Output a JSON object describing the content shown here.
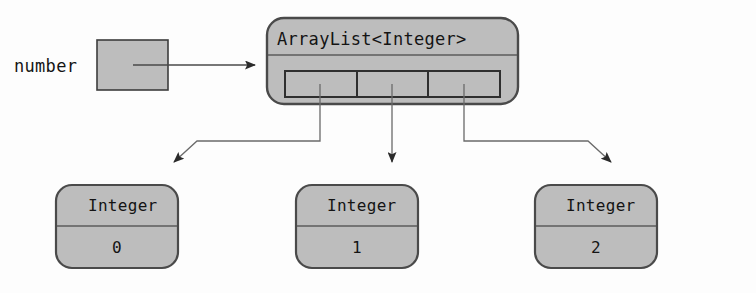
{
  "diagram": {
    "type": "object-reference-diagram",
    "colors": {
      "fill": "#bdbdbd",
      "stroke": "#3c3c3c",
      "text": "#141414",
      "background": "#fdfdfd",
      "arrow": "#4a4a4a"
    },
    "variable": {
      "label": "number",
      "box_name": "reference-box",
      "points_to": "ArrayList<Integer>"
    },
    "arraylist": {
      "title": "ArrayList<Integer>",
      "cell_count": 3,
      "cells": [
        {
          "index": 0,
          "points_to": "Integer 0"
        },
        {
          "index": 1,
          "points_to": "Integer 1"
        },
        {
          "index": 2,
          "points_to": "Integer 2"
        }
      ]
    },
    "objects": [
      {
        "type": "Integer",
        "value": "0"
      },
      {
        "type": "Integer",
        "value": "1"
      },
      {
        "type": "Integer",
        "value": "2"
      }
    ],
    "arrows": [
      {
        "name": "number-to-arraylist",
        "from": "reference-box",
        "to": "arraylist-box",
        "shape": "straight-right"
      },
      {
        "name": "cell0-to-integer0",
        "from": "arraylist-cell-0",
        "to": "integer-box-0",
        "shape": "down-left-diagonal"
      },
      {
        "name": "cell1-to-integer1",
        "from": "arraylist-cell-1",
        "to": "integer-box-1",
        "shape": "straight-down"
      },
      {
        "name": "cell2-to-integer2",
        "from": "arraylist-cell-2",
        "to": "integer-box-2",
        "shape": "down-right-diagonal"
      }
    ]
  }
}
